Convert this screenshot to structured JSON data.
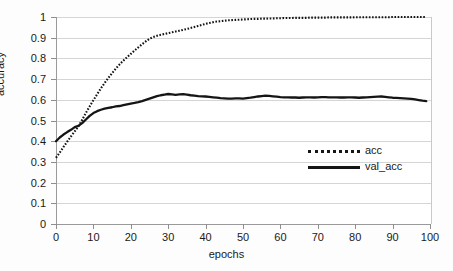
{
  "chart_data": {
    "type": "line",
    "title": "",
    "xlabel": "epochs",
    "ylabel": "accuracy",
    "xlim": [
      0,
      100
    ],
    "ylim": [
      0,
      1
    ],
    "grid": true,
    "legend_position": "center-right",
    "x_ticks": [
      "0",
      "10",
      "20",
      "30",
      "40",
      "50",
      "60",
      "70",
      "80",
      "90",
      "100"
    ],
    "y_ticks": [
      "0",
      "0.1",
      "0.2",
      "0.3",
      "0.4",
      "0.5",
      "0.6",
      "0.7",
      "0.8",
      "0.9",
      "1"
    ],
    "x": [
      0,
      1,
      2,
      3,
      4,
      5,
      6,
      7,
      8,
      9,
      10,
      11,
      12,
      13,
      14,
      15,
      16,
      17,
      18,
      19,
      20,
      21,
      22,
      23,
      24,
      25,
      26,
      27,
      28,
      29,
      30,
      31,
      32,
      33,
      34,
      35,
      36,
      37,
      38,
      39,
      40,
      41,
      42,
      43,
      44,
      45,
      46,
      47,
      48,
      49,
      50,
      51,
      52,
      53,
      54,
      55,
      56,
      57,
      58,
      59,
      60,
      61,
      62,
      63,
      64,
      65,
      66,
      67,
      68,
      69,
      70,
      71,
      72,
      73,
      74,
      75,
      76,
      77,
      78,
      79,
      80,
      81,
      82,
      83,
      84,
      85,
      86,
      87,
      88,
      89,
      90,
      91,
      92,
      93,
      94,
      95,
      96,
      97,
      98,
      99
    ],
    "series": [
      {
        "name": "acc",
        "style": "dotted",
        "values": [
          0.32,
          0.345,
          0.372,
          0.398,
          0.423,
          0.447,
          0.472,
          0.503,
          0.537,
          0.568,
          0.598,
          0.627,
          0.655,
          0.681,
          0.706,
          0.729,
          0.751,
          0.771,
          0.789,
          0.806,
          0.822,
          0.838,
          0.853,
          0.868,
          0.882,
          0.895,
          0.903,
          0.909,
          0.914,
          0.918,
          0.922,
          0.926,
          0.93,
          0.934,
          0.938,
          0.942,
          0.947,
          0.952,
          0.957,
          0.962,
          0.967,
          0.971,
          0.975,
          0.978,
          0.98,
          0.982,
          0.984,
          0.985,
          0.986,
          0.987,
          0.988,
          0.989,
          0.99,
          0.991,
          0.991,
          0.992,
          0.992,
          0.993,
          0.993,
          0.994,
          0.994,
          0.995,
          0.995,
          0.995,
          0.996,
          0.996,
          0.996,
          0.996,
          0.997,
          0.997,
          0.997,
          0.997,
          0.997,
          0.998,
          0.998,
          0.998,
          0.998,
          0.998,
          0.998,
          0.998,
          0.999,
          0.999,
          0.999,
          0.999,
          0.999,
          0.999,
          0.999,
          0.999,
          0.999,
          0.999,
          1.0,
          1.0,
          1.0,
          1.0,
          1.0,
          1.0,
          1.0,
          1.0,
          1.0,
          1.0
        ]
      },
      {
        "name": "val_acc",
        "style": "solid",
        "values": [
          0.4,
          0.418,
          0.432,
          0.444,
          0.455,
          0.468,
          0.474,
          0.487,
          0.505,
          0.522,
          0.536,
          0.545,
          0.552,
          0.557,
          0.561,
          0.564,
          0.568,
          0.57,
          0.574,
          0.578,
          0.582,
          0.585,
          0.589,
          0.594,
          0.6,
          0.606,
          0.612,
          0.618,
          0.622,
          0.625,
          0.628,
          0.626,
          0.624,
          0.626,
          0.627,
          0.625,
          0.622,
          0.62,
          0.618,
          0.617,
          0.616,
          0.614,
          0.612,
          0.61,
          0.608,
          0.607,
          0.606,
          0.606,
          0.607,
          0.607,
          0.606,
          0.608,
          0.61,
          0.613,
          0.616,
          0.618,
          0.62,
          0.619,
          0.617,
          0.615,
          0.613,
          0.612,
          0.612,
          0.611,
          0.611,
          0.61,
          0.611,
          0.612,
          0.612,
          0.611,
          0.612,
          0.613,
          0.613,
          0.612,
          0.612,
          0.612,
          0.611,
          0.611,
          0.612,
          0.612,
          0.611,
          0.61,
          0.611,
          0.612,
          0.613,
          0.614,
          0.615,
          0.616,
          0.614,
          0.612,
          0.61,
          0.609,
          0.608,
          0.607,
          0.606,
          0.604,
          0.602,
          0.599,
          0.596,
          0.594
        ]
      }
    ]
  },
  "legend": {
    "entries": [
      {
        "label": "acc",
        "swatch": "dotted-line-swatch"
      },
      {
        "label": "val_acc",
        "swatch": "solid-line-swatch"
      }
    ]
  },
  "caption": {
    "text": ""
  },
  "colors": {
    "series_line": "#151515",
    "gridline": "#d5d5d5",
    "axis": "#9a9a9a",
    "text": "#1a1a1a",
    "background": "#fdfdfd"
  }
}
